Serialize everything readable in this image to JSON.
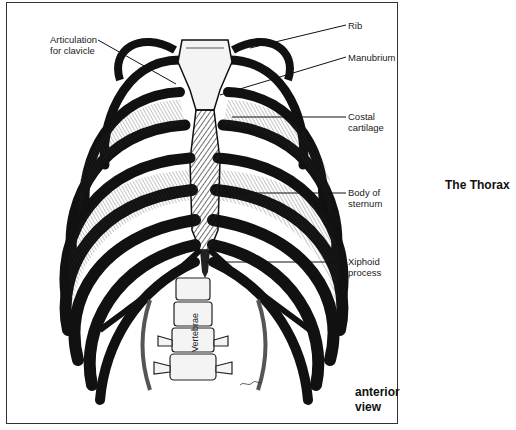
{
  "figure": {
    "title": "The Thorax",
    "view_label_line1": "anterior",
    "view_label_line2": "view",
    "labels": {
      "articulation_line1": "Articulation",
      "articulation_line2": "for clavicle",
      "rib": "Rib",
      "manubrium": "Manubrium",
      "costal_line1": "Costal",
      "costal_line2": "cartilage",
      "body_line1": "Body of",
      "body_line2": "sternum",
      "xiphoid_line1": "Xiphoid",
      "xiphoid_line2": "process",
      "vertebrae": "Vertebrae"
    },
    "colors": {
      "ink": "#111111",
      "bone": "#f4f4f4",
      "border": "#333333"
    }
  }
}
